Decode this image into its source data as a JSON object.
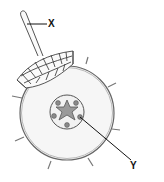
{
  "diagram": {
    "labels": {
      "x": "X",
      "y": "Y"
    },
    "parts": {
      "x_target": "root hair",
      "y_target": "vascular bundle (xylem/phloem in stele)"
    },
    "colors": {
      "outline": "#555555",
      "stele_fill": "#9a9a9a",
      "dots_fill": "#8a8a8a",
      "pointer": "#111111",
      "background": "#ffffff"
    }
  }
}
